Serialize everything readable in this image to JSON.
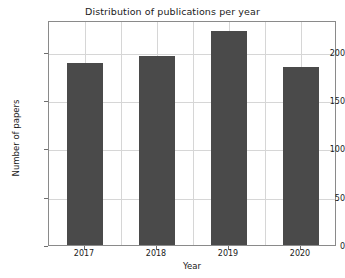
{
  "chart_data": {
    "type": "bar",
    "title": "Distribution of publications per year",
    "xlabel": "Year",
    "ylabel": "Number of papers",
    "categories": [
      "2017",
      "2018",
      "2019",
      "2020"
    ],
    "values": [
      189,
      196,
      222,
      184
    ],
    "ylim": [
      0,
      233
    ],
    "yticks": [
      0,
      50,
      100,
      150,
      200
    ],
    "ytick_labels": [
      "0",
      "50",
      "100",
      "150",
      "200"
    ],
    "grid": true,
    "legend": null,
    "bar_color": "#4a4a4a",
    "grid_color": "#d6d6d6",
    "frame_color": "#8a8a8a",
    "background": "#ffffff"
  }
}
